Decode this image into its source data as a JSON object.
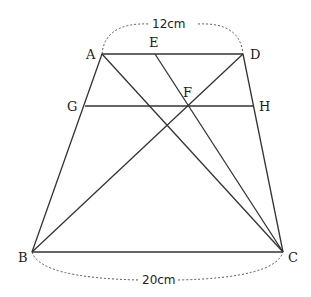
{
  "diagram": {
    "points": {
      "A": {
        "label": "A",
        "x": 102,
        "y": 54
      },
      "D": {
        "label": "D",
        "x": 243,
        "y": 54
      },
      "B": {
        "label": "B",
        "x": 32,
        "y": 252
      },
      "C": {
        "label": "C",
        "x": 283,
        "y": 252
      },
      "E": {
        "label": "E",
        "x": 155,
        "y": 54
      },
      "F": {
        "label": "F",
        "x": 187,
        "y": 105
      },
      "G": {
        "label": "G",
        "x": 85,
        "y": 106
      },
      "H": {
        "label": "H",
        "x": 253,
        "y": 106
      }
    },
    "dimensions": {
      "top": "12cm",
      "bottom": "20cm"
    },
    "segments": [
      "AD",
      "AB",
      "DC",
      "BC",
      "AC",
      "BD",
      "EC",
      "GH"
    ],
    "colors": {
      "line": "#333333",
      "dash": "#555555"
    }
  }
}
